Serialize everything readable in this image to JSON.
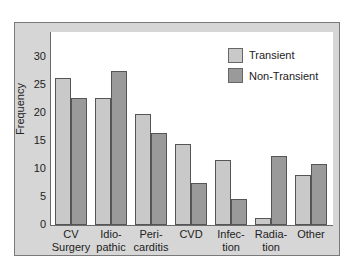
{
  "chart_data": {
    "type": "bar",
    "title": "",
    "xlabel": "",
    "ylabel": "Frequency",
    "ylim": [
      0,
      32
    ],
    "yticks": [
      0,
      5,
      10,
      15,
      20,
      25,
      30
    ],
    "grid": false,
    "legend_position": "upper right",
    "categories": [
      "CV Surgery",
      "Idiopathic",
      "Pericarditis",
      "CVD",
      "Infection",
      "Radiation",
      "Other"
    ],
    "category_labels": [
      [
        "CV",
        "Surgery"
      ],
      [
        "Idio-",
        "pathic"
      ],
      [
        "Peri-",
        "carditis"
      ],
      [
        "CVD",
        ""
      ],
      [
        "Infec-",
        "tion"
      ],
      [
        "Radia-",
        "tion"
      ],
      [
        "Other",
        ""
      ]
    ],
    "series": [
      {
        "name": "Transient",
        "color": "#c9c9c9",
        "values": [
          26,
          22.5,
          19.7,
          14.2,
          11.4,
          1,
          8.8
        ]
      },
      {
        "name": "Non-Transient",
        "color": "#9a9a9a",
        "values": [
          22.5,
          27.3,
          16.2,
          7.3,
          4.5,
          12.1,
          10.7
        ]
      }
    ]
  },
  "axis": {
    "ylabel": "Frequency",
    "yticks": [
      "0",
      "5",
      "10",
      "15",
      "20",
      "25",
      "30"
    ]
  },
  "legend": {
    "items": [
      {
        "label": "Transient",
        "color": "#c9c9c9"
      },
      {
        "label": "Non-Transient",
        "color": "#9a9a9a"
      }
    ]
  },
  "xlabels": [
    {
      "l1": "CV",
      "l2": "Surgery"
    },
    {
      "l1": "Idio-",
      "l2": "pathic"
    },
    {
      "l1": "Peri-",
      "l2": "carditis"
    },
    {
      "l1": "CVD",
      "l2": ""
    },
    {
      "l1": "Infec-",
      "l2": "tion"
    },
    {
      "l1": "Radia-",
      "l2": "tion"
    },
    {
      "l1": "Other",
      "l2": ""
    }
  ]
}
